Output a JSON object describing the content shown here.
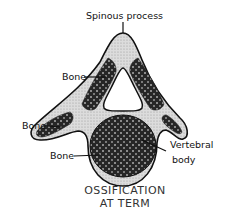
{
  "diagram": {
    "caption": {
      "line1": "OSSIFICATION",
      "line2": "AT TERM"
    },
    "labels": {
      "spinous_process": "Spinous process",
      "bone_upper": "Bone",
      "bone_left": "Bone",
      "bone_lower": "Bone",
      "vertebral_body_line1": "Vertebral",
      "vertebral_body_line2": "body"
    },
    "colors": {
      "cartilage": "#d8d8d8",
      "bone": "#2a2a2a",
      "outline": "#111111",
      "foramen": "#ffffff"
    }
  }
}
